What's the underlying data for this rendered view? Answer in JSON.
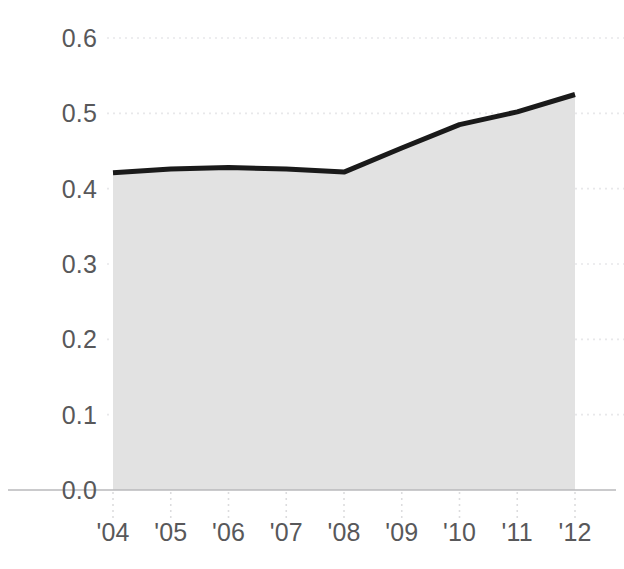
{
  "chart_data": {
    "type": "area",
    "title": "",
    "subtitle": "",
    "xlabel": "",
    "ylabel": "",
    "categories": [
      "'04",
      "'05",
      "'06",
      "'07",
      "'08",
      "'09",
      "'10",
      "'11",
      "'12"
    ],
    "values": [
      0.421,
      0.426,
      0.428,
      0.426,
      0.422,
      0.454,
      0.485,
      0.502,
      0.525
    ],
    "series": [
      {
        "name": "",
        "values": [
          0.421,
          0.426,
          0.428,
          0.426,
          0.422,
          0.454,
          0.485,
          0.502,
          0.525
        ]
      }
    ],
    "xlim": [
      0,
      8
    ],
    "ylim": [
      0.0,
      0.6
    ],
    "y_ticks": [
      0.0,
      0.1,
      0.2,
      0.3,
      0.4,
      0.5,
      0.6
    ],
    "y_tick_labels": [
      "0.0",
      "0.1",
      "0.2",
      "0.3",
      "0.4",
      "0.5",
      "0.6"
    ],
    "x_ticks": [
      0,
      1,
      2,
      3,
      4,
      5,
      6,
      7,
      8
    ],
    "x_tick_labels": [
      "'04",
      "'05",
      "'06",
      "'07",
      "'08",
      "'09",
      "'10",
      "'11",
      "'12"
    ],
    "grid": true,
    "grid_axis": "y",
    "grid_style": "dotted",
    "legend": false,
    "legend_position": "none",
    "annotations": [],
    "colors": {
      "line": "#1a1a1a",
      "area_fill": "#e2e2e2",
      "grid": "#e8e8ea",
      "axis": "#b9b9bb",
      "tick_text": "#58585a",
      "background": "#ffffff",
      "xtick_marks": "#dcdcde"
    },
    "line_width_px": 5
  },
  "axes": {
    "y_tick_label_color": "#58585a",
    "x_tick_label_color": "#58585a"
  }
}
